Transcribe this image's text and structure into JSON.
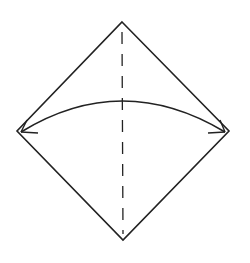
{
  "diagram": {
    "type": "origami-fold-instruction",
    "colors": {
      "background": "#ffffff",
      "stroke": "#222222"
    },
    "square": {
      "top": [
        122,
        22
      ],
      "right": [
        229,
        131
      ],
      "bottom": [
        123,
        240
      ],
      "left": [
        17,
        131
      ]
    },
    "fold_line": {
      "style": "valley-dashed",
      "from": [
        122,
        22
      ],
      "to": [
        123,
        240
      ]
    },
    "arrow": {
      "style": "fold-and-unfold",
      "from": "left-corner",
      "to": "right-corner",
      "apex_y": 101
    }
  }
}
